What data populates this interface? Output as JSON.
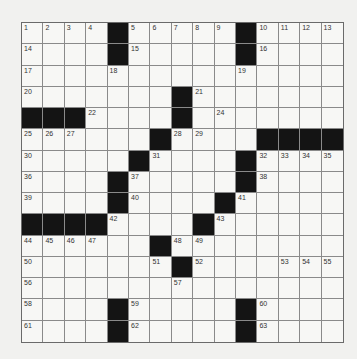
{
  "puzzle": {
    "rows": 15,
    "cols": 15,
    "layout": [
      "....#.....#....",
      "....#.....#....",
      "...............",
      ".......#.......",
      "###....#.......",
      "......#....####",
      ".....#....#....",
      "....#.....#....",
      "....#....#.....",
      "####....#......",
      "......#........",
      ".......#.......",
      "...............",
      "....#.....#....",
      "....#.....#...."
    ],
    "black_cells": [
      [
        0,
        4
      ],
      [
        0,
        10
      ],
      [
        1,
        4
      ],
      [
        1,
        10
      ],
      [
        3,
        7
      ],
      [
        4,
        0
      ],
      [
        4,
        1
      ],
      [
        4,
        2
      ],
      [
        4,
        8
      ],
      [
        5,
        6
      ],
      [
        5,
        11
      ],
      [
        5,
        12
      ],
      [
        5,
        13
      ],
      [
        5,
        14
      ],
      [
        6,
        5
      ],
      [
        6,
        10
      ],
      [
        7,
        4
      ],
      [
        7,
        10
      ],
      [
        8,
        4
      ],
      [
        8,
        9
      ],
      [
        9,
        0
      ],
      [
        9,
        1
      ],
      [
        9,
        2
      ],
      [
        9,
        3
      ],
      [
        9,
        8
      ],
      [
        10,
        6
      ],
      [
        10,
        12
      ],
      [
        10,
        13
      ],
      [
        10,
        14
      ],
      [
        11,
        7
      ],
      [
        13,
        4
      ],
      [
        13,
        10
      ],
      [
        14,
        4
      ],
      [
        14,
        10
      ]
    ],
    "numbers": [
      {
        "r": 0,
        "c": 0,
        "n": "1"
      },
      {
        "r": 0,
        "c": 1,
        "n": "2"
      },
      {
        "r": 0,
        "c": 2,
        "n": "3"
      },
      {
        "r": 0,
        "c": 3,
        "n": "4"
      },
      {
        "r": 0,
        "c": 5,
        "n": "5"
      },
      {
        "r": 0,
        "c": 6,
        "n": "6"
      },
      {
        "r": 0,
        "c": 7,
        "n": "7"
      },
      {
        "r": 0,
        "c": 8,
        "n": "8"
      },
      {
        "r": 0,
        "c": 9,
        "n": "9"
      },
      {
        "r": 0,
        "c": 11,
        "n": "10"
      },
      {
        "r": 0,
        "c": 12,
        "n": "11"
      },
      {
        "r": 0,
        "c": 13,
        "n": "12"
      },
      {
        "r": 0,
        "c": 14,
        "n": "13"
      },
      {
        "r": 1,
        "c": 0,
        "n": "14"
      },
      {
        "r": 1,
        "c": 5,
        "n": "15"
      },
      {
        "r": 1,
        "c": 11,
        "n": "16"
      },
      {
        "r": 2,
        "c": 0,
        "n": "17"
      },
      {
        "r": 2,
        "c": 4,
        "n": "18"
      },
      {
        "r": 2,
        "c": 10,
        "n": "19"
      },
      {
        "r": 3,
        "c": 0,
        "n": "20"
      },
      {
        "r": 3,
        "c": 8,
        "n": "21"
      },
      {
        "r": 4,
        "c": 3,
        "n": "22"
      },
      {
        "r": 4,
        "c": 7,
        "n": "23"
      },
      {
        "r": 4,
        "c": 9,
        "n": "24"
      },
      {
        "r": 5,
        "c": 0,
        "n": "25"
      },
      {
        "r": 5,
        "c": 1,
        "n": "26"
      },
      {
        "r": 5,
        "c": 2,
        "n": "27"
      },
      {
        "r": 5,
        "c": 7,
        "n": "28"
      },
      {
        "r": 5,
        "c": 8,
        "n": "29"
      },
      {
        "r": 6,
        "c": 0,
        "n": "30"
      },
      {
        "r": 6,
        "c": 6,
        "n": "31"
      },
      {
        "r": 6,
        "c": 11,
        "n": "32"
      },
      {
        "r": 6,
        "c": 12,
        "n": "33"
      },
      {
        "r": 6,
        "c": 13,
        "n": "34"
      },
      {
        "r": 6,
        "c": 14,
        "n": "35"
      },
      {
        "r": 7,
        "c": 0,
        "n": "36"
      },
      {
        "r": 7,
        "c": 5,
        "n": "37"
      },
      {
        "r": 7,
        "c": 11,
        "n": "38"
      },
      {
        "r": 8,
        "c": 0,
        "n": "39"
      },
      {
        "r": 8,
        "c": 5,
        "n": "40"
      },
      {
        "r": 8,
        "c": 10,
        "n": "41"
      },
      {
        "r": 9,
        "c": 4,
        "n": "42"
      },
      {
        "r": 9,
        "c": 9,
        "n": "43"
      },
      {
        "r": 10,
        "c": 0,
        "n": "44"
      },
      {
        "r": 10,
        "c": 1,
        "n": "45"
      },
      {
        "r": 10,
        "c": 2,
        "n": "46"
      },
      {
        "r": 10,
        "c": 3,
        "n": "47"
      },
      {
        "r": 10,
        "c": 7,
        "n": "48"
      },
      {
        "r": 10,
        "c": 8,
        "n": "49"
      },
      {
        "r": 11,
        "c": 0,
        "n": "50"
      },
      {
        "r": 11,
        "c": 6,
        "n": "51"
      },
      {
        "r": 11,
        "c": 8,
        "n": "52"
      },
      {
        "r": 11,
        "c": 12,
        "n": "53"
      },
      {
        "r": 11,
        "c": 13,
        "n": "54"
      },
      {
        "r": 11,
        "c": 14,
        "n": "55"
      },
      {
        "r": 12,
        "c": 0,
        "n": "56"
      },
      {
        "r": 12,
        "c": 7,
        "n": "57"
      },
      {
        "r": 13,
        "c": 0,
        "n": "58"
      },
      {
        "r": 13,
        "c": 5,
        "n": "59"
      },
      {
        "r": 13,
        "c": 11,
        "n": "60"
      },
      {
        "r": 14,
        "c": 0,
        "n": "61"
      },
      {
        "r": 14,
        "c": 5,
        "n": "62"
      },
      {
        "r": 14,
        "c": 11,
        "n": "63"
      }
    ],
    "colors": {
      "black": "#141414",
      "line": "#8a8a8a",
      "background": "#f1f1ef"
    }
  }
}
